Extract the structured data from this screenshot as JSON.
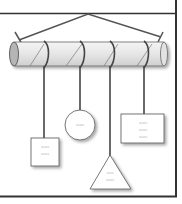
{
  "diagram": {
    "type": "hanging-mobile",
    "colors": {
      "frame": "#333333",
      "rod_fill": "#e8e8e8",
      "rod_end": "#b5b5b5",
      "string": "#4a4a4a",
      "card_fill": "#ffffff",
      "shadow": "#c8c8c8"
    },
    "hanging_items": [
      {
        "shape": "rectangle",
        "lines": [
          "≈≈≈≈≈",
          "≈≈≈≈≈"
        ]
      },
      {
        "shape": "circle",
        "lines": [
          "≈≈≈≈≈"
        ]
      },
      {
        "shape": "triangle",
        "lines": [
          "≈≈≈≈",
          "≈≈≈≈≈"
        ]
      },
      {
        "shape": "rectangle",
        "lines": [
          "≈≈≈≈≈",
          "≈≈≈≈≈",
          "≈≈≈≈≈"
        ]
      }
    ]
  }
}
